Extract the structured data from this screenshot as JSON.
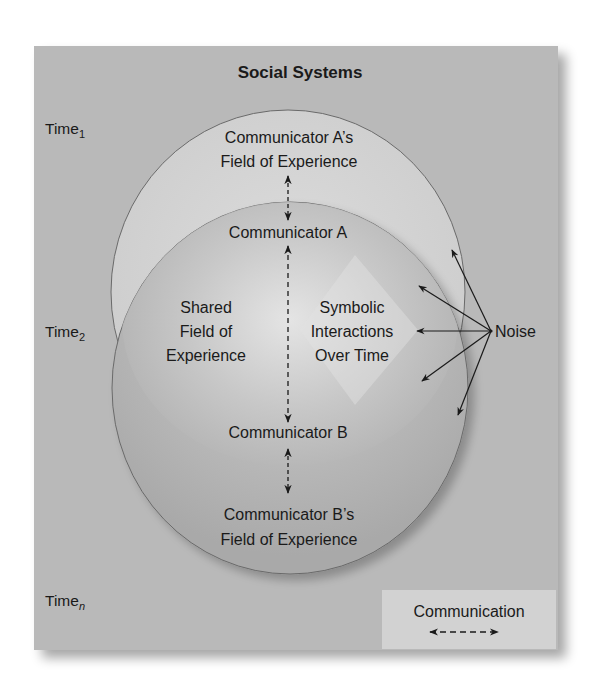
{
  "title": "Social Systems",
  "time_labels": {
    "t1": {
      "base": "Time",
      "sub": "1"
    },
    "t2": {
      "base": "Time",
      "sub": "2"
    },
    "tn": {
      "base": "Time",
      "sub": "n"
    }
  },
  "communicator_a": {
    "field_line1": "Communicator A’s",
    "field_line2": "Field of Experience",
    "name": "Communicator A"
  },
  "communicator_b": {
    "name": "Communicator B",
    "field_line1": "Communicator B’s",
    "field_line2": "Field of Experience"
  },
  "shared_field": {
    "line1": "Shared",
    "line2": "Field of",
    "line3": "Experience"
  },
  "symbolic": {
    "line1": "Symbolic",
    "line2": "Interactions",
    "line3": "Over Time"
  },
  "noise": {
    "label": "Noise",
    "arrow_count": 5
  },
  "legend": {
    "label": "Communication",
    "symbol": "dashed-double-arrow"
  },
  "colors": {
    "background_panel": "#b9b9b9",
    "upper_circle": "#d3d3d3",
    "lower_circle": "#b4b4b4",
    "center_highlight": "#e6e6e6",
    "legend_box": "#d2d2d2",
    "ink": "#1a1a1a"
  }
}
